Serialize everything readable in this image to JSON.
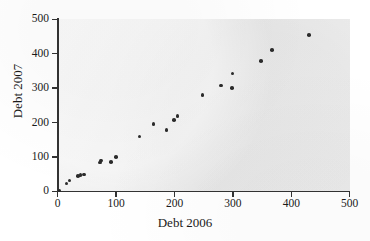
{
  "chart_data": {
    "type": "scatter",
    "title": "",
    "xlabel": "Debt 2006",
    "ylabel": "Debt 2007",
    "xlim": [
      0,
      500
    ],
    "ylim": [
      0,
      500
    ],
    "xticks": [
      0,
      100,
      200,
      300,
      400,
      500
    ],
    "yticks": [
      0,
      100,
      200,
      300,
      400,
      500
    ],
    "grid": false,
    "legend": null,
    "marker_color": "#2b2b2b",
    "panel_color": "#ebebeb",
    "axis_color": "#333333",
    "points": [
      {
        "x": 3,
        "y": 2
      },
      {
        "x": 15,
        "y": 23
      },
      {
        "x": 20,
        "y": 31
      },
      {
        "x": 35,
        "y": 44
      },
      {
        "x": 39,
        "y": 47
      },
      {
        "x": 45,
        "y": 49
      },
      {
        "x": 72,
        "y": 84
      },
      {
        "x": 74,
        "y": 90
      },
      {
        "x": 91,
        "y": 86
      },
      {
        "x": 100,
        "y": 100
      },
      {
        "x": 140,
        "y": 159
      },
      {
        "x": 164,
        "y": 196
      },
      {
        "x": 186,
        "y": 178
      },
      {
        "x": 199,
        "y": 208
      },
      {
        "x": 205,
        "y": 219
      },
      {
        "x": 248,
        "y": 280
      },
      {
        "x": 280,
        "y": 308
      },
      {
        "x": 298,
        "y": 300
      },
      {
        "x": 299,
        "y": 343
      },
      {
        "x": 348,
        "y": 378
      },
      {
        "x": 367,
        "y": 411
      },
      {
        "x": 430,
        "y": 455
      }
    ]
  },
  "axis": {
    "x_tick_labels": [
      "0",
      "100",
      "200",
      "300",
      "400",
      "500"
    ],
    "y_tick_labels": [
      "0",
      "100",
      "200",
      "300",
      "400",
      "500"
    ]
  }
}
